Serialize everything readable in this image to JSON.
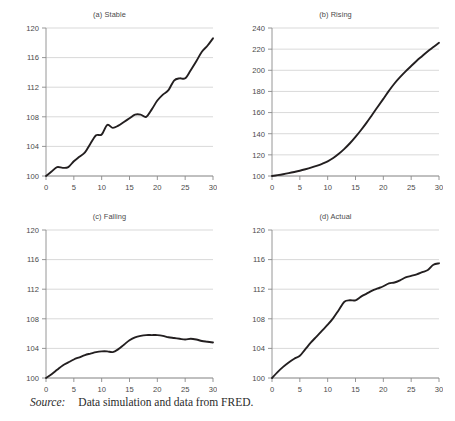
{
  "figure": {
    "source_label": "Source:",
    "source_text": "Data simulation and data from FRED.",
    "line_color": "#231f20",
    "grid_color": "#c8c8c8",
    "axis_color": "#8a8a8a",
    "background": "#ffffff"
  },
  "chart_data": [
    {
      "id": "a",
      "type": "line",
      "title": "(a) Stable",
      "xlabel": "",
      "ylabel": "",
      "xlim": [
        0,
        30
      ],
      "ylim": [
        100,
        120
      ],
      "xticks": [
        0,
        5,
        10,
        15,
        20,
        25,
        30
      ],
      "yticks": [
        100,
        104,
        108,
        112,
        116,
        120
      ],
      "grid": true,
      "legend": "none",
      "x": [
        0,
        1,
        2,
        3,
        4,
        5,
        6,
        7,
        8,
        9,
        10,
        11,
        12,
        13,
        14,
        15,
        16,
        17,
        18,
        19,
        20,
        21,
        22,
        23,
        24,
        25,
        26,
        27,
        28,
        29,
        30
      ],
      "values": [
        100.0,
        100.6,
        101.2,
        101.1,
        101.2,
        102.0,
        102.6,
        103.2,
        104.4,
        105.5,
        105.6,
        106.9,
        106.5,
        106.8,
        107.3,
        107.8,
        108.3,
        108.3,
        108.0,
        109.0,
        110.2,
        111.0,
        111.6,
        112.9,
        113.2,
        113.2,
        114.3,
        115.5,
        116.8,
        117.6,
        118.6
      ]
    },
    {
      "id": "b",
      "type": "line",
      "title": "(b) Rising",
      "xlabel": "",
      "ylabel": "",
      "xlim": [
        0,
        30
      ],
      "ylim": [
        100,
        240
      ],
      "xticks": [
        0,
        5,
        10,
        15,
        20,
        25,
        30
      ],
      "yticks": [
        100,
        120,
        140,
        160,
        180,
        200,
        220,
        240
      ],
      "grid": true,
      "legend": "none",
      "x": [
        0,
        1,
        2,
        3,
        4,
        5,
        6,
        7,
        8,
        9,
        10,
        11,
        12,
        13,
        14,
        15,
        16,
        17,
        18,
        19,
        20,
        21,
        22,
        23,
        24,
        25,
        26,
        27,
        28,
        29,
        30
      ],
      "values": [
        100.0,
        100.8,
        101.7,
        102.7,
        103.8,
        105.0,
        106.4,
        107.9,
        109.6,
        111.5,
        113.8,
        117.0,
        121.0,
        125.7,
        131.0,
        137.0,
        143.5,
        150.5,
        158.0,
        165.5,
        173.0,
        180.5,
        187.5,
        193.5,
        199.0,
        204.0,
        209.0,
        213.5,
        218.0,
        222.0,
        226.0
      ]
    },
    {
      "id": "c",
      "type": "line",
      "title": "(c) Falling",
      "xlabel": "",
      "ylabel": "",
      "xlim": [
        0,
        30
      ],
      "ylim": [
        100,
        120
      ],
      "xticks": [
        0,
        5,
        10,
        15,
        20,
        25,
        30
      ],
      "yticks": [
        100,
        104,
        108,
        112,
        116,
        120
      ],
      "grid": true,
      "legend": "none",
      "x": [
        0,
        1,
        2,
        3,
        4,
        5,
        6,
        7,
        8,
        9,
        10,
        11,
        12,
        13,
        14,
        15,
        16,
        17,
        18,
        19,
        20,
        21,
        22,
        23,
        24,
        25,
        26,
        27,
        28,
        29,
        30
      ],
      "values": [
        100.0,
        100.5,
        101.1,
        101.7,
        102.1,
        102.5,
        102.8,
        103.1,
        103.3,
        103.5,
        103.6,
        103.6,
        103.5,
        103.9,
        104.5,
        105.1,
        105.5,
        105.7,
        105.8,
        105.8,
        105.8,
        105.7,
        105.5,
        105.4,
        105.3,
        105.2,
        105.3,
        105.2,
        105.0,
        104.9,
        104.8
      ]
    },
    {
      "id": "d",
      "type": "line",
      "title": "(d) Actual",
      "xlabel": "",
      "ylabel": "",
      "xlim": [
        0,
        30
      ],
      "ylim": [
        100,
        120
      ],
      "xticks": [
        0,
        5,
        10,
        15,
        20,
        25,
        30
      ],
      "yticks": [
        100,
        104,
        108,
        112,
        116,
        120
      ],
      "grid": true,
      "legend": "none",
      "x": [
        0,
        1,
        2,
        3,
        4,
        5,
        6,
        7,
        8,
        9,
        10,
        11,
        12,
        13,
        14,
        15,
        16,
        17,
        18,
        19,
        20,
        21,
        22,
        23,
        24,
        25,
        26,
        27,
        28,
        29,
        30
      ],
      "values": [
        100.0,
        100.8,
        101.5,
        102.1,
        102.6,
        103.0,
        103.9,
        104.8,
        105.6,
        106.4,
        107.2,
        108.1,
        109.2,
        110.3,
        110.5,
        110.5,
        111.0,
        111.4,
        111.8,
        112.1,
        112.4,
        112.8,
        112.9,
        113.2,
        113.6,
        113.8,
        114.0,
        114.3,
        114.6,
        115.3,
        115.5
      ]
    }
  ]
}
